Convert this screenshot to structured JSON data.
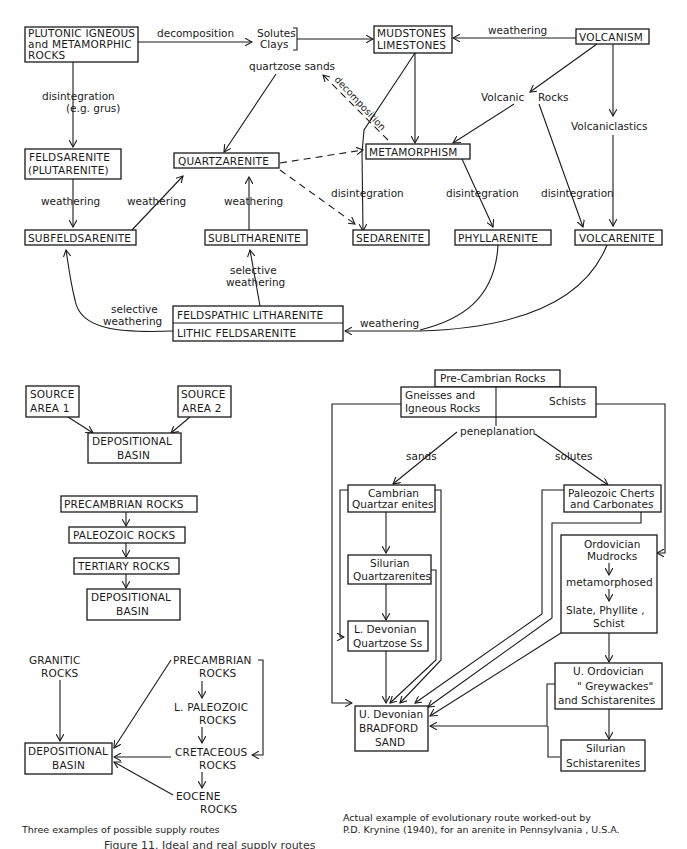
{
  "top_diagram": {
    "boxes": {
      "plutonic": [
        "PLUTONIC IGNEOUS",
        "and METAMORPHIC",
        "ROCKS"
      ],
      "mudstones": [
        "MUDSTONES",
        "LIMESTONES"
      ],
      "volcanism": "VOLCANISM",
      "feldsarenite": [
        "FELDSARENITE",
        "(PLUTARENITE)"
      ],
      "quartzarenite": "QUARTZARENITE",
      "metamorphism": "METAMORPHISM",
      "subfeldsarenite": "SUBFELDSARENITE",
      "sublitharenite": "SUBLITHARENITE",
      "sedarenite": "SEDARENITE",
      "phyllarenite": "PHYLLARENITE",
      "volcarenite": "VOLCARENITE",
      "feldspathic_litharenite": "FELDSPATHIC LITHARENITE",
      "lithic_feldsarenite": "LITHIC FELDSARENITE"
    },
    "labels": {
      "decomposition_top": "decomposition",
      "solutes": "Solutes",
      "clays": "Clays",
      "weathering_volc": "weathering",
      "quartzose_sands": "quartzose sands",
      "decomposition_diag": "decomposition",
      "disintegration_grus": "disintegration",
      "eg_grus": "(e.g. grus)",
      "volcanic_rocks_1": "Volcanic",
      "volcanic_rocks_2": "Rocks",
      "volcaniclastics": "Volcaniclastics",
      "weathering_feld": "weathering",
      "weathering_subfeld": "weathering",
      "weathering_sublith": "weathering",
      "disintegration_sed": "disintegration",
      "disintegration_phyl": "disintegration",
      "disintegration_volc": "disintegration",
      "selective_weathering_1a": "selective",
      "selective_weathering_1b": "weathering",
      "selective_weathering_2a": "selective",
      "selective_weathering_2b": "weathering",
      "weathering_bottom": "weathering"
    }
  },
  "left_examples": {
    "ex1": {
      "source1": [
        "SOURCE",
        "AREA  1"
      ],
      "source2": [
        "SOURCE",
        "AREA  2"
      ],
      "basin": [
        "DEPOSITIONAL",
        "BASIN"
      ]
    },
    "ex2": {
      "steps": [
        "PRECAMBRIAN ROCKS",
        "PALEOZOIC ROCKS",
        "TERTIARY ROCKS"
      ],
      "basin": [
        "DEPOSITIONAL",
        "BASIN"
      ]
    },
    "ex3": {
      "granitic": [
        "GRANITIC",
        "ROCKS"
      ],
      "precambrian": [
        "PRECAMBRIAN",
        "ROCKS"
      ],
      "l_paleozoic": [
        "L. PALEOZOIC",
        "ROCKS"
      ],
      "cretaceous": [
        "CRETACEOUS",
        "ROCKS"
      ],
      "eocene": [
        "EOCENE",
        "ROCKS"
      ],
      "basin": [
        "DEPOSITIONAL",
        "BASIN"
      ]
    },
    "caption": "Three examples of possible supply routes"
  },
  "right_example": {
    "precambrian": "Pre-Cambrian Rocks",
    "gneisses": [
      "Gneisses and",
      "Igneous Rocks"
    ],
    "schists": "Schists",
    "peneplanation": "peneplanation",
    "sands": "sands",
    "solutes": "solutes",
    "cambrian": [
      "Cambrian",
      "Quartzar enites"
    ],
    "paleozoic_cherts": [
      "Paleozoic Cherts",
      "and Carbonates"
    ],
    "silurian_q": [
      "Silurian",
      "Quartzarenites"
    ],
    "l_devonian": [
      "L. Devonian",
      "Quartzose Ss"
    ],
    "ordovician_mud": [
      "Ordovician",
      "Mudrocks"
    ],
    "metamorphosed": "metamorphosed",
    "slate": [
      "Slate, Phyllite ,",
      "Schist"
    ],
    "u_ordovician": [
      "U.  Ordovician",
      "\" Greywackes\"",
      "and Schistarenites"
    ],
    "u_devonian": [
      "U. Devonian",
      "BRADFORD",
      "SAND"
    ],
    "silurian_s": [
      "Silurian",
      "Schistarenites"
    ],
    "caption": [
      "Actual example of evolutionary route worked-out by",
      "P.D. Krynine (1940), for an arenite in  Pennsylvania , U.S.A."
    ]
  },
  "figure_caption": "Figure 11.  Ideal and real supply routes"
}
